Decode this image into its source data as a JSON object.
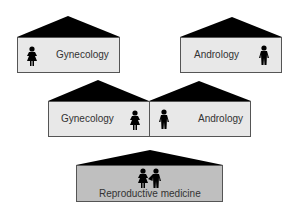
{
  "diagram": {
    "top_left": {
      "label": "Gynecology",
      "icon": "female-figure-icon"
    },
    "top_right": {
      "label": "Andrology",
      "icon": "male-figure-icon"
    },
    "middle_left": {
      "label": "Gynecology",
      "icon": "female-figure-icon"
    },
    "middle_right": {
      "label": "Andrology",
      "icon": "male-figure-icon"
    },
    "bottom": {
      "label": "Reproductive medicine",
      "icon": "couple-figures-icon"
    }
  },
  "colors": {
    "roof": "#000000",
    "box_light": "#e8e8e8",
    "box_dark": "#bfbfbf",
    "border": "#555555",
    "text": "#333333"
  }
}
